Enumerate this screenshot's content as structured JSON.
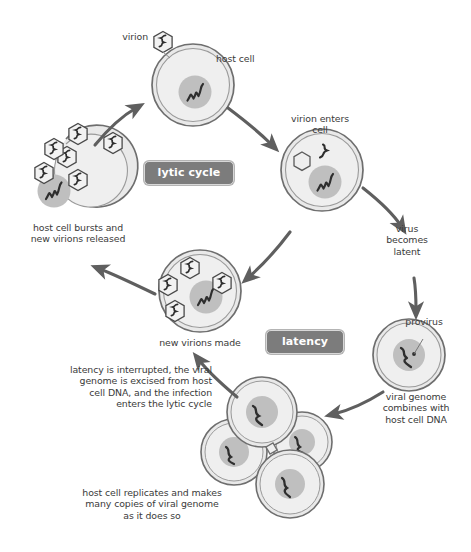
{
  "diagram": {
    "colors": {
      "cell_fill": "#ededed",
      "cell_fill_inner": "#e4e4e4",
      "cell_stroke": "#6e6e6e",
      "nucleus_fill": "#bdbdbd",
      "capsid_fill": "#f2f2f2",
      "capsid_stroke": "#4a4a4a",
      "genome_stroke": "#333333",
      "arrow_color": "#5f5f5f",
      "badge_fill": "#7c7c7c",
      "badge_text": "#ffffff",
      "label_text": "#3a3a3a"
    },
    "badges": [
      {
        "id": "lytic-cycle",
        "label": "lytic cycle"
      },
      {
        "id": "latency",
        "label": "latency"
      }
    ],
    "labels": {
      "virion": "virion",
      "host_cell": "host cell",
      "virion_enters_cell": "virion enters\ncell",
      "virus_becomes_latent": "virus\nbecomes\nlatent",
      "provirus": "provirus",
      "viral_genome_combines": "viral genome\ncombines with\nhost cell DNA",
      "host_cell_replicates": "host cell replicates and makes\nmany copies of viral genome\nas it does so",
      "latency_interrupted": "latency is interrupted, the viral\ngenome is excised from host\ncell DNA, and the infection\nenters the lytic cycle",
      "new_virions_made": "new virions made",
      "host_cell_bursts": "host cell bursts and\nnew virions released"
    },
    "stages": [
      {
        "id": "host-cell",
        "label": "host cell",
        "virion_count": 0,
        "note": "free virion attached outside at top"
      },
      {
        "id": "infected-cell",
        "label": "virion enters cell",
        "virion_count": 1,
        "note": "empty capsid plus released genome"
      },
      {
        "id": "provirus-cell",
        "label": "provirus",
        "virion_count": 0,
        "note": "viral genome integrated in nucleus"
      },
      {
        "id": "replicating-cells",
        "label": "host cell replicates and makes many copies of viral genome as it does so",
        "cell_count": 4
      },
      {
        "id": "new-virions-cell",
        "label": "new virions made",
        "virion_count": 4
      },
      {
        "id": "bursting-cell",
        "label": "host cell bursts and new virions released",
        "virion_count": 7
      }
    ],
    "arrows": [
      {
        "id": "arrow-host-to-infected",
        "from": "host-cell",
        "to": "infected-cell"
      },
      {
        "id": "arrow-infected-to-latent",
        "from": "infected-cell",
        "to": "provirus-cell"
      },
      {
        "id": "arrow-provirus-to-replicating",
        "from": "provirus-cell",
        "to": "replicating-cells"
      },
      {
        "id": "arrow-replicating-to-new-virions",
        "from": "replicating-cells",
        "to": "new-virions-cell"
      },
      {
        "id": "arrow-infected-to-new-virions",
        "from": "infected-cell",
        "to": "new-virions-cell"
      },
      {
        "id": "arrow-new-virions-to-burst",
        "from": "new-virions-cell",
        "to": "bursting-cell"
      },
      {
        "id": "arrow-burst-to-host",
        "from": "bursting-cell",
        "to": "host-cell"
      }
    ]
  }
}
